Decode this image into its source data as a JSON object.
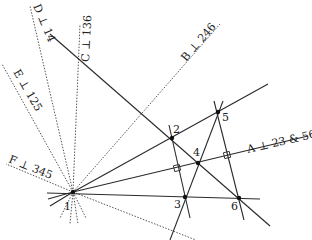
{
  "diagram": {
    "points": [
      {
        "id": "1",
        "label": "1",
        "x": 73,
        "y": 192,
        "lx": 64,
        "ly": 210
      },
      {
        "id": "2",
        "label": "2",
        "x": 172,
        "y": 138,
        "lx": 173,
        "ly": 133
      },
      {
        "id": "3",
        "label": "3",
        "x": 185,
        "y": 197,
        "lx": 174,
        "ly": 208
      },
      {
        "id": "4",
        "label": "4",
        "x": 198,
        "y": 163,
        "lx": 193,
        "ly": 156
      },
      {
        "id": "5",
        "label": "5",
        "x": 218,
        "y": 112,
        "lx": 222,
        "ly": 121
      },
      {
        "id": "6",
        "label": "6",
        "x": 239,
        "y": 198,
        "lx": 231,
        "ly": 210
      }
    ],
    "solid_lines": [
      {
        "id": "line-1-2-5",
        "x1": 73,
        "y1": 192,
        "x2": 268,
        "y2": 84
      },
      {
        "id": "line-A",
        "x1": 73,
        "y1": 192,
        "x2": 308,
        "y2": 136
      },
      {
        "id": "line-1-3-6",
        "x1": 47,
        "y1": 193,
        "x2": 260,
        "y2": 199
      },
      {
        "id": "line-D-2-4-6",
        "x1": 50,
        "y1": 34,
        "x2": 270,
        "y2": 226
      },
      {
        "id": "line-2-3",
        "x1": 169,
        "y1": 125,
        "x2": 190,
        "y2": 218
      },
      {
        "id": "line-5-6",
        "x1": 214,
        "y1": 101,
        "x2": 244,
        "y2": 220
      },
      {
        "id": "line-3-5",
        "x1": 223,
        "y1": 101,
        "x2": 170,
        "y2": 240
      },
      {
        "id": "stub-1-a",
        "x1": 73,
        "y1": 192,
        "x2": 48,
        "y2": 199
      },
      {
        "id": "stub-1-b",
        "x1": 73,
        "y1": 192,
        "x2": 50,
        "y2": 206
      }
    ],
    "dashed_lines": [
      {
        "id": "line-B",
        "label": "B ⊥ 246",
        "x1": 73,
        "y1": 192,
        "x2": 220,
        "y2": 24
      },
      {
        "id": "line-C",
        "label": "C ⊥ 136",
        "x1": 73,
        "y1": 192,
        "x2": 80,
        "y2": 24
      },
      {
        "id": "line-D",
        "label": "D ⊥ 14",
        "x1": 73,
        "y1": 192,
        "x2": 30,
        "y2": 6
      },
      {
        "id": "line-E",
        "label": "E ⊥ 125",
        "x1": 73,
        "y1": 192,
        "x2": 2,
        "y2": 64
      },
      {
        "id": "line-F",
        "label": "F ⊥ 345",
        "x1": 73,
        "y1": 192,
        "x2": 6,
        "y2": 164
      },
      {
        "id": "line-G",
        "label": "",
        "x1": 73,
        "y1": 192,
        "x2": 196,
        "y2": 240
      },
      {
        "id": "stub-1",
        "label": "",
        "x1": 73,
        "y1": 192,
        "x2": 60,
        "y2": 218
      },
      {
        "id": "stub-2",
        "label": "",
        "x1": 73,
        "y1": 192,
        "x2": 70,
        "y2": 224
      },
      {
        "id": "stub-3",
        "label": "",
        "x1": 73,
        "y1": 192,
        "x2": 78,
        "y2": 224
      },
      {
        "id": "stub-4",
        "label": "",
        "x1": 73,
        "y1": 192,
        "x2": 86,
        "y2": 218
      }
    ],
    "line_labels": [
      {
        "id": "A",
        "text": "A ⊥ 23 & 56",
        "x": 248,
        "y": 153,
        "rot": -13
      },
      {
        "id": "B",
        "text": "B ⊥ 246",
        "x": 186,
        "y": 62,
        "rot": -49
      },
      {
        "id": "C",
        "text": "C ⊥ 136",
        "x": 89,
        "y": 62,
        "rot": -87
      },
      {
        "id": "D",
        "text": "D ⊥ 14",
        "x": 33,
        "y": 6,
        "rot": 67
      },
      {
        "id": "E",
        "text": "E ⊥ 125",
        "x": 13,
        "y": 72,
        "rot": 60
      },
      {
        "id": "F",
        "text": "F ⊥ 345",
        "x": 8,
        "y": 162,
        "rot": 22
      }
    ],
    "right_angle_markers": [
      {
        "id": "ra-2-3-A",
        "x": 177,
        "y": 168
      },
      {
        "id": "ra-5-6-A",
        "x": 227,
        "y": 155
      }
    ]
  }
}
